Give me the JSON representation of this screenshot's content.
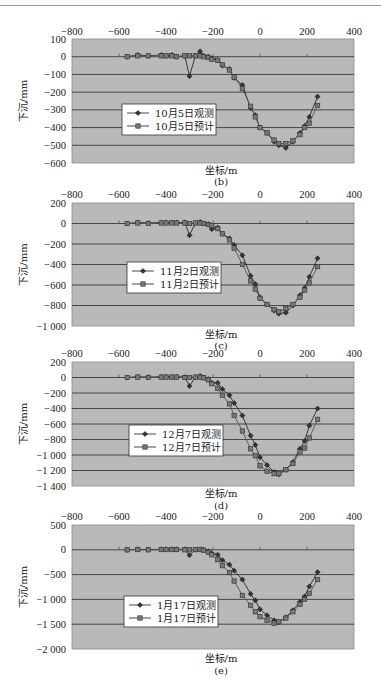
{
  "chart_data": [
    {
      "type": "line",
      "panel": "(b)",
      "xlabel": "坐标/m",
      "ylabel": "下沉/mm",
      "xlim": [
        -800,
        400
      ],
      "xticks": [
        -800,
        -600,
        -400,
        -200,
        0,
        200,
        400
      ],
      "ylim": [
        -600,
        100
      ],
      "yticks": [
        100,
        0,
        -100,
        -200,
        -300,
        -400,
        -500,
        -600
      ],
      "ytick_labels": [
        "100",
        "0",
        "-100",
        "-200",
        "-300",
        "-400",
        "-500",
        "-600"
      ],
      "grid": true,
      "legend_position": "center-left",
      "series": [
        {
          "name": "10月5日观测",
          "marker": "diamond",
          "x": [
            -565,
            -520,
            -475,
            -420,
            -400,
            -375,
            -355,
            -320,
            -300,
            -275,
            -255,
            -240,
            -220,
            -205,
            -180,
            -160,
            -130,
            -110,
            -75,
            -40,
            -20,
            0,
            30,
            60,
            80,
            110,
            140,
            170,
            190,
            210,
            245
          ],
          "y": [
            0,
            10,
            5,
            10,
            5,
            10,
            0,
            5,
            -110,
            5,
            30,
            5,
            0,
            -10,
            -20,
            -50,
            -70,
            -120,
            -160,
            -290,
            -330,
            -400,
            -430,
            -480,
            -500,
            -515,
            -480,
            -430,
            -390,
            -340,
            -225
          ]
        },
        {
          "name": "10月5日预计",
          "marker": "square",
          "x": [
            -565,
            -520,
            -475,
            -420,
            -400,
            -375,
            -355,
            -320,
            -300,
            -275,
            -255,
            -240,
            -220,
            -205,
            -180,
            -160,
            -130,
            -110,
            -75,
            -40,
            -20,
            0,
            30,
            60,
            80,
            110,
            140,
            170,
            190,
            210,
            245
          ],
          "y": [
            0,
            5,
            5,
            5,
            5,
            5,
            0,
            5,
            5,
            5,
            5,
            0,
            -5,
            -15,
            -20,
            -45,
            -75,
            -115,
            -180,
            -280,
            -340,
            -400,
            -430,
            -470,
            -490,
            -490,
            -475,
            -440,
            -400,
            -375,
            -275
          ]
        }
      ]
    },
    {
      "type": "line",
      "panel": "(c)",
      "xlabel": "坐标/m",
      "ylabel": "下沉/mm",
      "xlim": [
        -800,
        400
      ],
      "xticks": [
        -800,
        -600,
        -400,
        -200,
        0,
        200,
        400
      ],
      "ylim": [
        -1000,
        200
      ],
      "yticks": [
        200,
        0,
        -200,
        -400,
        -600,
        -800,
        -1000
      ],
      "ytick_labels": [
        "200",
        "0",
        "-200",
        "-400",
        "-600",
        "-800",
        "-1 000"
      ],
      "grid": true,
      "legend_position": "center-left",
      "series": [
        {
          "name": "11月2日观测",
          "marker": "diamond",
          "x": [
            -565,
            -520,
            -475,
            -420,
            -400,
            -375,
            -355,
            -320,
            -300,
            -275,
            -255,
            -240,
            -220,
            -205,
            -180,
            -160,
            -130,
            -110,
            -75,
            -40,
            -20,
            0,
            30,
            60,
            80,
            110,
            140,
            170,
            190,
            210,
            245
          ],
          "y": [
            0,
            10,
            5,
            10,
            10,
            10,
            10,
            10,
            -115,
            5,
            15,
            0,
            -5,
            -55,
            -40,
            -100,
            -145,
            -210,
            -310,
            -510,
            -590,
            -720,
            -790,
            -850,
            -880,
            -870,
            -800,
            -700,
            -630,
            -520,
            -340
          ]
        },
        {
          "name": "11月2日预计",
          "marker": "square",
          "x": [
            -565,
            -520,
            -475,
            -420,
            -400,
            -375,
            -355,
            -320,
            -300,
            -275,
            -255,
            -240,
            -220,
            -205,
            -180,
            -160,
            -130,
            -110,
            -75,
            -40,
            -20,
            0,
            30,
            60,
            80,
            110,
            140,
            170,
            190,
            210,
            245
          ],
          "y": [
            0,
            5,
            0,
            5,
            5,
            5,
            5,
            5,
            0,
            5,
            5,
            0,
            -10,
            -20,
            -50,
            -100,
            -160,
            -240,
            -400,
            -560,
            -640,
            -730,
            -790,
            -840,
            -860,
            -830,
            -790,
            -720,
            -650,
            -580,
            -420
          ]
        }
      ]
    },
    {
      "type": "line",
      "panel": "(d)",
      "xlabel": "坐标/m",
      "ylabel": "下沉/mm",
      "xlim": [
        -800,
        400
      ],
      "xticks": [
        -800,
        -600,
        -400,
        -200,
        0,
        200,
        400
      ],
      "ylim": [
        -1400,
        200
      ],
      "yticks": [
        200,
        0,
        -200,
        -400,
        -600,
        -800,
        -1000,
        -1200,
        -1400
      ],
      "ytick_labels": [
        "200",
        "0",
        "-200",
        "-400",
        "-600",
        "-800",
        "-1 000",
        "-1 200",
        "-1 400"
      ],
      "grid": true,
      "legend_position": "center-left",
      "series": [
        {
          "name": "12月7日观测",
          "marker": "diamond",
          "x": [
            -565,
            -520,
            -475,
            -420,
            -400,
            -375,
            -355,
            -320,
            -300,
            -275,
            -255,
            -240,
            -220,
            -205,
            -180,
            -160,
            -130,
            -110,
            -75,
            -40,
            -20,
            0,
            30,
            60,
            80,
            110,
            140,
            170,
            190,
            210,
            245
          ],
          "y": [
            0,
            10,
            5,
            10,
            10,
            10,
            10,
            5,
            -110,
            5,
            20,
            0,
            -20,
            -70,
            -70,
            -150,
            -230,
            -330,
            -490,
            -750,
            -870,
            -1030,
            -1130,
            -1220,
            -1250,
            -1190,
            -1090,
            -920,
            -820,
            -620,
            -400
          ]
        },
        {
          "name": "12月7日预计",
          "marker": "square",
          "x": [
            -565,
            -520,
            -475,
            -420,
            -400,
            -375,
            -355,
            -320,
            -300,
            -275,
            -255,
            -240,
            -220,
            -205,
            -180,
            -160,
            -130,
            -110,
            -75,
            -40,
            -20,
            0,
            30,
            60,
            80,
            110,
            140,
            170,
            190,
            210,
            245
          ],
          "y": [
            0,
            5,
            0,
            5,
            5,
            5,
            5,
            0,
            0,
            5,
            5,
            -5,
            -30,
            -80,
            -140,
            -230,
            -340,
            -490,
            -690,
            -920,
            -1010,
            -1140,
            -1210,
            -1240,
            -1240,
            -1190,
            -1110,
            -960,
            -910,
            -780,
            -540
          ]
        }
      ]
    },
    {
      "type": "line",
      "panel": "(e)",
      "xlabel": "坐标/m",
      "ylabel": "下沉/mm",
      "xlim": [
        -800,
        400
      ],
      "xticks": [
        -800,
        -600,
        -400,
        -200,
        0,
        200,
        400
      ],
      "ylim": [
        -2000,
        500
      ],
      "yticks": [
        500,
        0,
        -500,
        -1000,
        -1500,
        -2000
      ],
      "ytick_labels": [
        "500",
        "0",
        "-500",
        "-1 000",
        "-1 500",
        "-2 000"
      ],
      "grid": true,
      "legend_position": "center-left",
      "series": [
        {
          "name": "1月17日观测",
          "marker": "diamond",
          "x": [
            -565,
            -520,
            -475,
            -420,
            -400,
            -375,
            -355,
            -320,
            -300,
            -275,
            -255,
            -240,
            -220,
            -205,
            -180,
            -160,
            -130,
            -110,
            -75,
            -40,
            -20,
            0,
            30,
            60,
            80,
            110,
            140,
            170,
            190,
            210,
            245
          ],
          "y": [
            0,
            10,
            5,
            10,
            10,
            10,
            10,
            10,
            -110,
            5,
            10,
            0,
            -30,
            -70,
            -100,
            -210,
            -300,
            -420,
            -600,
            -890,
            -1020,
            -1200,
            -1320,
            -1420,
            -1460,
            -1360,
            -1220,
            -1050,
            -940,
            -740,
            -450
          ]
        },
        {
          "name": "1月17日预计",
          "marker": "square",
          "x": [
            -565,
            -520,
            -475,
            -420,
            -400,
            -375,
            -355,
            -320,
            -300,
            -275,
            -255,
            -240,
            -220,
            -205,
            -180,
            -160,
            -130,
            -110,
            -75,
            -40,
            -20,
            0,
            30,
            60,
            80,
            110,
            140,
            170,
            190,
            210,
            245
          ],
          "y": [
            0,
            5,
            0,
            5,
            5,
            5,
            5,
            0,
            0,
            5,
            5,
            -10,
            -50,
            -100,
            -200,
            -320,
            -460,
            -630,
            -920,
            -1120,
            -1250,
            -1350,
            -1420,
            -1480,
            -1450,
            -1380,
            -1250,
            -1100,
            -1000,
            -880,
            -600
          ]
        }
      ]
    }
  ]
}
